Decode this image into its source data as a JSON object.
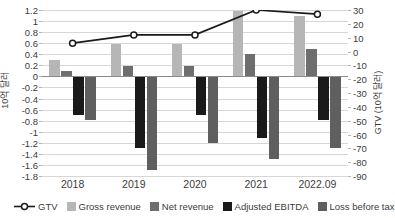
{
  "chart_data": {
    "type": "bar",
    "title": "",
    "subtitle": "",
    "xlabel": "",
    "ylabel": "10억 달러",
    "ylabel_right": "GTV (10억 달러)",
    "categories": [
      "2018",
      "2019",
      "2020",
      "2021",
      "2022.09"
    ],
    "ylim": [
      -1.8,
      1.2
    ],
    "ylim_right": [
      -90,
      30
    ],
    "ytick_step": 0.2,
    "ytick_step_right": 10,
    "yticks": [
      "1.2",
      "1",
      "0.8",
      "0.6",
      "0.4",
      "0.2",
      "0",
      "-0.2",
      "-0.4",
      "-0.6",
      "-0.8",
      "-1",
      "-1.2",
      "-1.4",
      "-1.6",
      "-1.8"
    ],
    "ytick_values": [
      1.2,
      1.0,
      0.8,
      0.6,
      0.4,
      0.2,
      0,
      -0.2,
      -0.4,
      -0.6,
      -0.8,
      -1.0,
      -1.2,
      -1.4,
      -1.6,
      -1.8
    ],
    "yticks_right": [
      "30",
      "20",
      "10",
      "0",
      "-10",
      "-20",
      "-30",
      "-40",
      "-50",
      "-60",
      "-70",
      "-80",
      "-90"
    ],
    "ytick_values_right": [
      30,
      20,
      10,
      0,
      -10,
      -20,
      -30,
      -40,
      -50,
      -60,
      -70,
      -80,
      -90
    ],
    "grid": true,
    "legend_position": "bottom",
    "series": [
      {
        "name": "GTV",
        "type": "line",
        "axis": "right",
        "color": "#1a1a1a",
        "marker": "open-circle",
        "values": [
          6,
          12,
          12,
          30,
          27
        ]
      },
      {
        "name": "Gross revenue",
        "type": "bar",
        "axis": "left",
        "color": "#b6b6b6",
        "values": [
          0.29,
          0.59,
          0.59,
          1.19,
          1.09
        ]
      },
      {
        "name": "Net revenue",
        "type": "bar",
        "axis": "left",
        "color": "#6e6e6e",
        "values": [
          0.09,
          0.19,
          0.19,
          0.4,
          0.49
        ]
      },
      {
        "name": "Adjusted EBITDA",
        "type": "bar",
        "axis": "left",
        "color": "#1a1a1a",
        "values": [
          -0.69,
          -1.29,
          -0.69,
          -1.11,
          -0.79
        ]
      },
      {
        "name": "Loss before tax",
        "type": "bar",
        "axis": "left",
        "color": "#5f5f5f",
        "values": [
          -0.79,
          -1.69,
          -1.21,
          -1.49,
          -1.29
        ]
      }
    ]
  },
  "colors": {
    "gtv_line": "#1a1a1a",
    "gross_revenue": "#b6b6b6",
    "net_revenue": "#6e6e6e",
    "adjusted_ebitda": "#1a1a1a",
    "loss_before_tax": "#5f5f5f",
    "gridline": "#d7d7d7",
    "zero_line": "#8a8a8a",
    "text": "#3c3c3c",
    "background": "#ffffff"
  }
}
